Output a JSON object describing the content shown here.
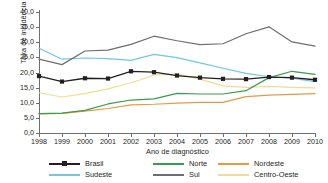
{
  "chart_data": {
    "type": "line",
    "title": "",
    "xlabel": "Ano de diagnóstico",
    "ylabel": "Taxa de incidência",
    "categories": [
      "1998",
      "1999",
      "2000",
      "2001",
      "2002",
      "2003",
      "2004",
      "2005",
      "2006",
      "2007",
      "2008",
      "2009",
      "2010"
    ],
    "x": [
      1998,
      1999,
      2000,
      2001,
      2002,
      2003,
      2004,
      2005,
      2006,
      2007,
      2008,
      2009,
      2010
    ],
    "ylim": [
      0,
      40
    ],
    "yticks": [
      "0,0",
      "5,0",
      "10,0",
      "15,0",
      "20,0",
      "25,0",
      "30,0",
      "35,0",
      "40,0"
    ],
    "ytick_values": [
      0,
      5,
      10,
      15,
      20,
      25,
      30,
      35,
      40
    ],
    "grid": false,
    "legend_position": "bottom",
    "series": [
      {
        "name": "Brasil",
        "color": "#231f20",
        "marker": "square",
        "values": [
          18.8,
          17.0,
          18.1,
          18.0,
          20.4,
          20.1,
          19.0,
          18.3,
          17.9,
          17.8,
          18.5,
          18.3,
          17.6
        ]
      },
      {
        "name": "Sudeste",
        "color": "#6ec6e8",
        "marker": "none",
        "values": [
          28.0,
          24.4,
          24.8,
          24.6,
          24.0,
          26.0,
          24.9,
          23.2,
          21.4,
          19.7,
          18.6,
          18.1,
          17.0
        ]
      },
      {
        "name": "Norte",
        "color": "#3a9b4e",
        "marker": "none",
        "values": [
          6.4,
          6.6,
          7.5,
          9.6,
          10.9,
          11.3,
          13.1,
          12.9,
          12.9,
          14.0,
          18.3,
          20.4,
          19.4
        ]
      },
      {
        "name": "Sul",
        "color": "#6d6e71",
        "marker": "none",
        "values": [
          24.4,
          22.6,
          27.1,
          27.4,
          29.3,
          32.0,
          30.5,
          29.2,
          29.5,
          32.8,
          35.1,
          30.1,
          28.7
        ]
      },
      {
        "name": "Nordeste",
        "color": "#e8993f",
        "marker": "none",
        "values": [
          6.3,
          6.5,
          7.2,
          8.1,
          9.3,
          9.5,
          9.9,
          10.1,
          10.1,
          12.0,
          12.5,
          12.8,
          13.0
        ]
      },
      {
        "name": "Centro-Oeste",
        "color": "#f3dd8a",
        "marker": "none",
        "values": [
          13.3,
          11.9,
          13.0,
          14.6,
          16.6,
          19.1,
          19.5,
          17.8,
          15.6,
          15.1,
          15.4,
          15.1,
          14.9
        ]
      }
    ]
  }
}
